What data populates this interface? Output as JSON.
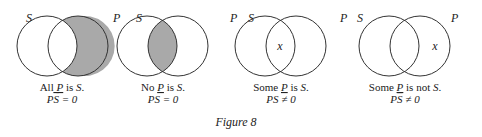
{
  "figure": {
    "caption": "Figure 8",
    "shade_color": "#a9a9a9",
    "stroke_color": "#333333",
    "diagrams": [
      {
        "left_label": "S",
        "right_label": "P",
        "shaded": "P-not-S",
        "mark": "",
        "statement": {
          "pre": "All ",
          "var1": "P",
          "mid": " is ",
          "var2": "S",
          "post": "."
        },
        "equation": {
          "a": "P",
          "b": "S",
          "b_bar": true,
          "rel": " = ",
          "val": "0"
        }
      },
      {
        "left_label": "S",
        "right_label": "P",
        "shaded": "PS",
        "mark": "",
        "statement": {
          "pre": "No ",
          "var1": "P",
          "mid": " is ",
          "var2": "S",
          "post": "."
        },
        "equation": {
          "a": "P",
          "b": "S",
          "b_bar": false,
          "rel": " = ",
          "val": "0"
        }
      },
      {
        "left_label": "S",
        "right_label": "P",
        "shaded": "none",
        "mark": "x",
        "mark_region": "PS",
        "statement": {
          "pre": "Some ",
          "var1": "P",
          "mid": " is ",
          "var2": "S",
          "post": "."
        },
        "equation": {
          "a": "P",
          "b": "S",
          "b_bar": false,
          "rel": " ≠ ",
          "val": "0"
        }
      },
      {
        "left_label": "S",
        "right_label": "P",
        "shaded": "none",
        "mark": "x",
        "mark_region": "P-not-S",
        "statement": {
          "pre": "Some ",
          "var1": "P",
          "mid": " is not ",
          "var2": "S",
          "post": "."
        },
        "equation": {
          "a": "P",
          "b": "S",
          "b_bar": true,
          "rel": " ≠ ",
          "val": "0"
        }
      }
    ]
  }
}
